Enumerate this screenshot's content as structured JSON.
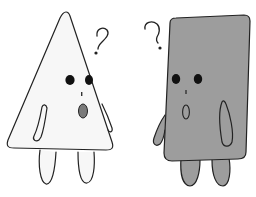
{
  "illustration": {
    "description": "Two confused cartoon characters: a white cone and a gray rectangular block, each with a question mark",
    "background": "#ffffff",
    "characters": [
      {
        "name": "cone",
        "shape": "triangle",
        "body_color": "#f7f7f7",
        "mouth_color": "#7a7a7a",
        "symbol": "?"
      },
      {
        "name": "block",
        "shape": "rectangle",
        "body_color": "#9d9d9d",
        "mouth_color": "#9d9d9d",
        "symbol": "?"
      }
    ],
    "outline_color": "#222222",
    "eye_color": "#111111"
  }
}
